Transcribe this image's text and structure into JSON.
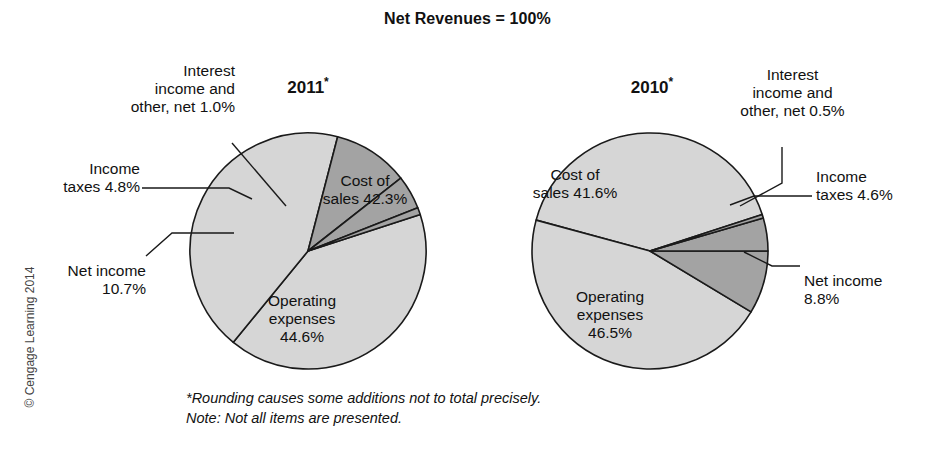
{
  "title": "Net Revenues = 100%",
  "footnote": "*Rounding causes some additions not to total precisely.\n Note: Not all items are presented.",
  "copyright": "© Cengage Learning 2014",
  "colors": {
    "large_slice": "#d6d6d6",
    "small_slice": "#a3a3a3",
    "outline": "#1a1a1a",
    "text": "#111111",
    "background": "#ffffff"
  },
  "panels": {
    "left": {
      "year_label": "2011",
      "year_star": "*",
      "cost_of_sales": "Cost of\nsales 42.3%",
      "operating_expenses": "Operating\nexpenses\n44.6%",
      "net_income": "Net income\n10.7%",
      "income_taxes": "Income\ntaxes 4.8%",
      "interest_income": "Interest\nincome and\nother, net 1.0%"
    },
    "right": {
      "year_label": "2010",
      "year_star": "*",
      "cost_of_sales": "Cost of\nsales 41.6%",
      "operating_expenses": "Operating\nexpenses\n46.5%",
      "net_income": "Net income\n8.8%",
      "income_taxes": "Income\ntaxes 4.6%",
      "interest_income": "Interest\nincome and\nother, net 0.5%"
    }
  },
  "chart_data": [
    {
      "type": "pie",
      "title": "2011*",
      "labels": [
        "Cost of sales",
        "Operating expenses",
        "Net income",
        "Income taxes",
        "Interest income and other, net"
      ],
      "values": [
        42.3,
        44.6,
        10.7,
        4.8,
        1.0
      ],
      "unit": "%",
      "total_label": "Net Revenues = 100%",
      "colors": [
        "#d6d6d6",
        "#d6d6d6",
        "#a3a3a3",
        "#a3a3a3",
        "#a3a3a3"
      ],
      "start_angle_deg": -18,
      "direction": "clockwise",
      "legend": "none"
    },
    {
      "type": "pie",
      "title": "2010*",
      "labels": [
        "Cost of sales",
        "Operating expenses",
        "Net income",
        "Income taxes",
        "Interest income and other, net"
      ],
      "values": [
        41.6,
        46.5,
        8.8,
        4.6,
        0.5
      ],
      "unit": "%",
      "total_label": "Net Revenues = 100%",
      "colors": [
        "#d6d6d6",
        "#d6d6d6",
        "#a3a3a3",
        "#a3a3a3",
        "#a3a3a3"
      ],
      "start_angle_deg": -18,
      "direction": "counterclockwise",
      "legend": "none"
    }
  ]
}
